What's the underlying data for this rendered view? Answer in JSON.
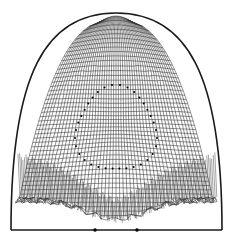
{
  "figure": {
    "type": "deformed-mesh-diagram",
    "width": 234,
    "height": 247,
    "colors": {
      "background": "#ffffff",
      "line": "#1a1a1a",
      "mesh": "#333333",
      "marker": "#000000"
    },
    "outer_boundary": {
      "apex": [
        116,
        13
      ],
      "left_base": [
        11,
        230
      ],
      "right_base": [
        222,
        230
      ],
      "stroke_width": 1.6
    },
    "baseline": {
      "y": 230,
      "x_start": 11,
      "x_end": 222,
      "markers_x": [
        95,
        137
      ]
    },
    "inner_region": {
      "center": [
        116,
        130
      ],
      "radius_x": 40,
      "radius_y": 40,
      "dotted_outline": true
    },
    "mesh": {
      "top_y": 22,
      "bottom_y_center": 220,
      "bottom_y_sides": 200,
      "left_x": 16,
      "right_x": 217,
      "rows": 46,
      "cols": 52
    }
  }
}
